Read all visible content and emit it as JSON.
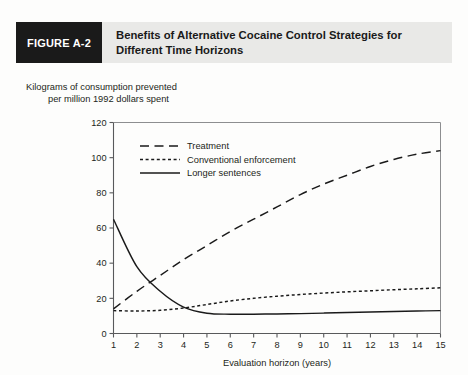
{
  "figure": {
    "tag": "FIGURE A-2",
    "title_line1": "Benefits of Alternative Cocaine Control Strategies for",
    "title_line2": "Different Time Horizons",
    "tag_background": "#1a1a1a",
    "header_background": "#e9e9e7"
  },
  "axis_caption": {
    "line1": "Kilograms of consumption prevented",
    "line2": "per million 1992 dollars spent"
  },
  "chart_data": {
    "type": "line",
    "title": "Benefits of Alternative Cocaine Control Strategies for Different Time Horizons",
    "xlabel": "Evaluation horizon (years)",
    "ylabel": "Kilograms of consumption prevented per million 1992 dollars spent",
    "xlim": [
      1,
      15
    ],
    "ylim": [
      0,
      120
    ],
    "xticks": [
      1,
      2,
      3,
      4,
      5,
      6,
      7,
      8,
      9,
      10,
      11,
      12,
      13,
      14,
      15
    ],
    "yticks": [
      0,
      20,
      40,
      60,
      80,
      100,
      120
    ],
    "xticklabels": [
      "1",
      "2",
      "3",
      "4",
      "5",
      "6",
      "7",
      "8",
      "9",
      "10",
      "11",
      "12",
      "13",
      "14",
      "15"
    ],
    "yticklabels": [
      "0",
      "20",
      "40",
      "60",
      "80",
      "100",
      "120"
    ],
    "grid": false,
    "legend_position": "upper-left-inside",
    "x": [
      1,
      2,
      3,
      4,
      5,
      6,
      7,
      8,
      9,
      10,
      11,
      12,
      13,
      14,
      15
    ],
    "series": [
      {
        "name": "Treatment",
        "style": "long-dash",
        "color": "#1a1a1a",
        "values": [
          14,
          24,
          33,
          42,
          50,
          58,
          65,
          72,
          79,
          85,
          90,
          95,
          99,
          102,
          104
        ]
      },
      {
        "name": "Conventional enforcement",
        "style": "short-dash",
        "color": "#1a1a1a",
        "values": [
          13,
          12.8,
          13.2,
          14.5,
          16.5,
          18.5,
          20,
          21.2,
          22.2,
          23,
          23.7,
          24.3,
          24.9,
          25.4,
          26
        ]
      },
      {
        "name": "Longer sentences",
        "style": "solid",
        "color": "#1a1a1a",
        "values": [
          65,
          38,
          24,
          15,
          11.5,
          11,
          11,
          11.1,
          11.3,
          11.6,
          11.9,
          12.2,
          12.5,
          12.8,
          13
        ]
      }
    ]
  }
}
